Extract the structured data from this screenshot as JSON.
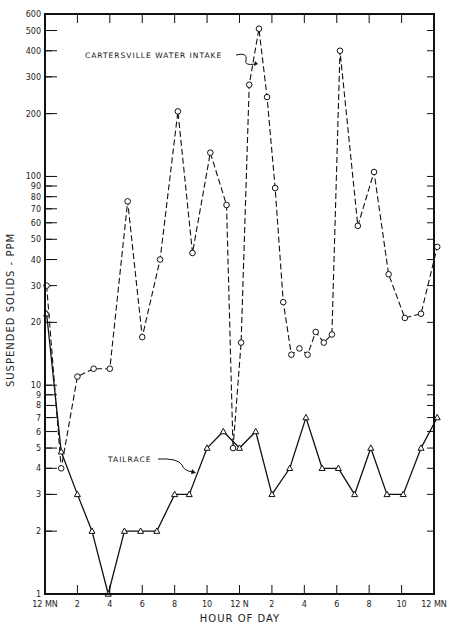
{
  "chart_data": {
    "type": "line",
    "title": "",
    "xlabel": "HOUR OF DAY",
    "ylabel": "SUSPENDED SOLIDS - PPM",
    "yscale": "log",
    "ylim": [
      1,
      600
    ],
    "xlim": [
      0,
      24
    ],
    "grid": false,
    "legend_position": "inline annotations",
    "x_tick_labels": [
      {
        "hour": 0,
        "label": "12 MN"
      },
      {
        "hour": 2,
        "label": "2"
      },
      {
        "hour": 4,
        "label": "4"
      },
      {
        "hour": 6,
        "label": "6"
      },
      {
        "hour": 8,
        "label": "8"
      },
      {
        "hour": 10,
        "label": "10"
      },
      {
        "hour": 12,
        "label": "12 N"
      },
      {
        "hour": 14,
        "label": "2"
      },
      {
        "hour": 16,
        "label": "4"
      },
      {
        "hour": 18,
        "label": "6"
      },
      {
        "hour": 20,
        "label": "8"
      },
      {
        "hour": 22,
        "label": "10"
      },
      {
        "hour": 24,
        "label": "12 MN"
      }
    ],
    "y_tick_labels": [
      {
        "value": 1,
        "label": "1"
      },
      {
        "value": 2,
        "label": "2"
      },
      {
        "value": 3,
        "label": "3"
      },
      {
        "value": 4,
        "label": "4"
      },
      {
        "value": 5,
        "label": "5"
      },
      {
        "value": 6,
        "label": "6"
      },
      {
        "value": 7,
        "label": "7"
      },
      {
        "value": 8,
        "label": "8"
      },
      {
        "value": 9,
        "label": "9"
      },
      {
        "value": 10,
        "label": "10"
      },
      {
        "value": 20,
        "label": "20"
      },
      {
        "value": 30,
        "label": "30"
      },
      {
        "value": 40,
        "label": "40"
      },
      {
        "value": 50,
        "label": "50"
      },
      {
        "value": 60,
        "label": "60"
      },
      {
        "value": 70,
        "label": "70"
      },
      {
        "value": 80,
        "label": "80"
      },
      {
        "value": 90,
        "label": "90"
      },
      {
        "value": 100,
        "label": "100"
      },
      {
        "value": 200,
        "label": "200"
      },
      {
        "value": 300,
        "label": "300"
      },
      {
        "value": 400,
        "label": "400"
      },
      {
        "value": 500,
        "label": "500"
      },
      {
        "value": 600,
        "label": "600"
      }
    ],
    "series": [
      {
        "name": "CARTERSVILLE WATER INTAKE",
        "marker": "circle",
        "line_style": "dashed",
        "x": [
          0.1,
          1.0,
          2.0,
          3.0,
          4.0,
          5.1,
          6.0,
          7.1,
          8.2,
          9.1,
          10.2,
          11.2,
          11.6,
          12.1,
          12.6,
          13.2,
          13.7,
          14.2,
          14.7,
          15.2,
          15.7,
          16.2,
          16.7,
          17.2,
          17.7,
          18.2,
          19.3,
          20.3,
          21.2,
          22.2,
          23.2,
          24.2
        ],
        "values": [
          30,
          4,
          11,
          12,
          12,
          76,
          17,
          40,
          205,
          43,
          130,
          73,
          5,
          16,
          275,
          510,
          240,
          88,
          25,
          14,
          15,
          14,
          18,
          16,
          17.5,
          400,
          58,
          105,
          34,
          21,
          22,
          46
        ]
      },
      {
        "name": "TAILRACE",
        "marker": "triangle",
        "line_style": "solid",
        "x": [
          0.1,
          1.0,
          2.0,
          2.9,
          3.9,
          4.9,
          5.9,
          6.9,
          8.0,
          8.9,
          10.0,
          11.0,
          12.0,
          13.0,
          14.0,
          15.1,
          16.1,
          17.1,
          18.1,
          19.1,
          20.1,
          21.1,
          22.1,
          23.2,
          24.2
        ],
        "values": [
          22,
          4.8,
          3,
          2,
          1,
          2,
          2,
          2,
          3,
          3,
          5,
          6,
          5,
          6,
          3,
          4,
          7,
          4,
          4,
          3,
          5,
          3,
          3,
          5,
          7
        ]
      }
    ],
    "annotations": [
      {
        "text": "CARTERSVILLE WATER INTAKE",
        "series": "CARTERSVILLE WATER INTAKE"
      },
      {
        "text": "TAILRACE",
        "series": "TAILRACE"
      }
    ]
  }
}
